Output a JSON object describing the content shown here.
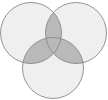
{
  "diagram": {
    "type": "venn",
    "set_count": 3,
    "labels": [],
    "colors": {
      "background": "#ffffff",
      "circle_fill": "#efefef",
      "overlap_fill": "#b9b9b9",
      "stroke": "#8a8a8a"
    },
    "circles": [
      {
        "name": "top-left",
        "cx": 31,
        "cy": 33,
        "r": 30.5
      },
      {
        "name": "top-right",
        "cx": 76,
        "cy": 33,
        "r": 30.5
      },
      {
        "name": "bottom",
        "cx": 53,
        "cy": 68,
        "r": 30.5
      }
    ]
  }
}
